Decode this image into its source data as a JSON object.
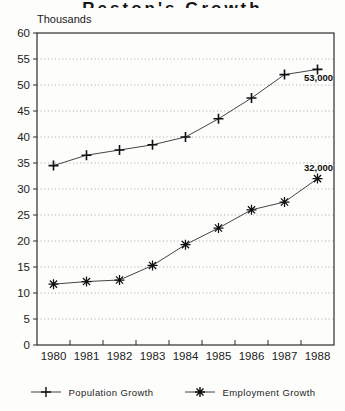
{
  "page": {
    "background": "#fdfdfc",
    "ink": "#1f1f1f"
  },
  "chart_data": {
    "type": "line",
    "title": "Reston's Growth",
    "unit_label": "Thousands",
    "categories": [
      "1980",
      "1981",
      "1982",
      "1983",
      "1984",
      "1985",
      "1986",
      "1987",
      "1988"
    ],
    "series": [
      {
        "name": "Population Growth",
        "marker": "plus",
        "values": [
          34.5,
          36.5,
          37.5,
          38.5,
          40,
          43.5,
          47.5,
          52,
          53
        ],
        "end_label": "53,000",
        "end_label_position": "below"
      },
      {
        "name": "Employment Growth",
        "marker": "asterisk",
        "values": [
          11.7,
          12.2,
          12.5,
          15.3,
          19.3,
          22.5,
          26,
          27.5,
          32
        ],
        "end_label": "32,000",
        "end_label_position": "above"
      }
    ],
    "ylim": [
      0,
      60
    ],
    "ytick_step": 5,
    "grid": "horizontal-dotted",
    "legend_position": "bottom"
  }
}
